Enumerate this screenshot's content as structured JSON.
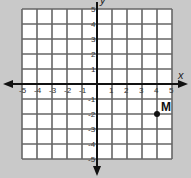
{
  "diagram": {
    "type": "coordinate-plane",
    "x_axis_label": "x",
    "y_axis_label": "y",
    "x_range": [
      -5,
      5
    ],
    "y_range": [
      -5,
      5
    ],
    "x_ticks": [
      "-5",
      "-4",
      "-3",
      "-2",
      "-1",
      "1",
      "2",
      "3",
      "4",
      "5"
    ],
    "y_ticks": [
      "5",
      "4",
      "3",
      "2",
      "1",
      "-1",
      "-2",
      "-3",
      "-4",
      "-5"
    ],
    "points": [
      {
        "label": "M",
        "x": 4,
        "y": -2
      }
    ],
    "colors": {
      "background": "#c9c9c9",
      "grid_fill": "#ffffff",
      "grid_line": "#666666",
      "axis": "#111111",
      "point": "#111111"
    }
  }
}
